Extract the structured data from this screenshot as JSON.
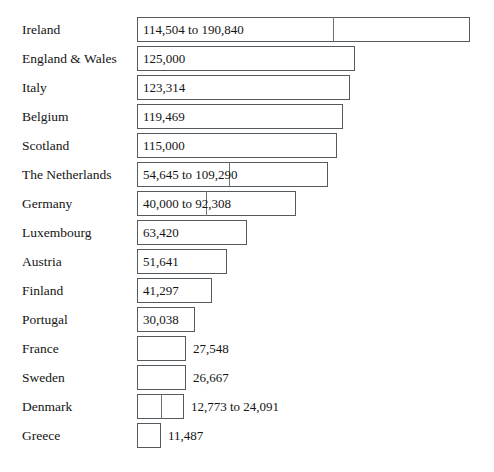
{
  "chart_data": {
    "type": "bar",
    "orientation": "horizontal",
    "title": "",
    "subtitle": "",
    "xlabel": "",
    "ylabel": "",
    "grid": false,
    "legend": null,
    "axis_visible": false,
    "value_unit": "persons",
    "note": "Horizontal bar chart; several countries show a range (low to high estimate) rendered as a bar with an inner divider marking the lower bound.",
    "categories": [
      "Ireland",
      "England & Wales",
      "Italy",
      "Belgium",
      "Scotland",
      "The Netherlands",
      "Germany",
      "Luxembourg",
      "Austria",
      "Finland",
      "Portugal",
      "France",
      "Sweden",
      "Denmark",
      "Greece"
    ],
    "values": [
      190840,
      125000,
      123314,
      119469,
      115000,
      109290,
      92308,
      63420,
      51641,
      41297,
      30038,
      27548,
      26667,
      24091,
      11487
    ],
    "low_values": [
      114504,
      null,
      null,
      null,
      null,
      54645,
      40000,
      null,
      null,
      null,
      null,
      null,
      null,
      12773,
      null
    ],
    "value_labels": [
      "114,504 to 190,840",
      "125,000",
      "123,314",
      "119,469",
      "115,000",
      "54,645 to 109,290",
      "40,000 to 92,308",
      "63,420",
      "51,641",
      "41,297",
      "30,038",
      "27,548",
      "26,667",
      "12,773 to 24,091",
      "11,487"
    ],
    "label_placement": [
      "inside",
      "inside",
      "inside",
      "inside",
      "inside",
      "inside",
      "inside",
      "inside",
      "inside",
      "inside",
      "inside",
      "outside",
      "outside",
      "outside",
      "outside"
    ],
    "xlim": [
      0,
      190840
    ]
  },
  "rows": [
    {
      "label": "Ireland",
      "value_label": "114,504 to 190,840",
      "placement": "inside",
      "top": 15,
      "bar_end": 470,
      "divider": 333
    },
    {
      "label": "England & Wales",
      "value_label": "125,000",
      "placement": "inside",
      "top": 44,
      "bar_end": 355,
      "divider": null
    },
    {
      "label": "Italy",
      "value_label": "123,314",
      "placement": "inside",
      "top": 73,
      "bar_end": 350,
      "divider": null
    },
    {
      "label": "Belgium",
      "value_label": "119,469",
      "placement": "inside",
      "top": 102,
      "bar_end": 343,
      "divider": null
    },
    {
      "label": "Scotland",
      "value_label": "115,000",
      "placement": "inside",
      "top": 131,
      "bar_end": 337,
      "divider": null
    },
    {
      "label": "The Netherlands",
      "value_label": "54,645 to 109,290",
      "placement": "inside",
      "top": 160,
      "bar_end": 328,
      "divider": 229
    },
    {
      "label": "Germany",
      "value_label": "40,000 to 92,308",
      "placement": "inside",
      "top": 189,
      "bar_end": 296,
      "divider": 206
    },
    {
      "label": "Luxembourg",
      "value_label": "63,420",
      "placement": "inside",
      "top": 218,
      "bar_end": 247,
      "divider": null
    },
    {
      "label": "Austria",
      "value_label": "51,641",
      "placement": "inside",
      "top": 247,
      "bar_end": 227,
      "divider": null
    },
    {
      "label": "Finland",
      "value_label": "41,297",
      "placement": "inside",
      "top": 276,
      "bar_end": 212,
      "divider": null
    },
    {
      "label": "Portugal",
      "value_label": "30,038",
      "placement": "inside",
      "top": 305,
      "bar_end": 195,
      "divider": null
    },
    {
      "label": "France",
      "value_label": "27,548",
      "placement": "outside",
      "top": 334,
      "bar_end": 186,
      "divider": null
    },
    {
      "label": "Sweden",
      "value_label": "26,667",
      "placement": "outside",
      "top": 363,
      "bar_end": 186,
      "divider": null
    },
    {
      "label": "Denmark",
      "value_label": "12,773 to 24,091",
      "placement": "outside",
      "top": 392,
      "bar_end": 184,
      "divider": 161
    },
    {
      "label": "Greece",
      "value_label": "11,487",
      "placement": "outside",
      "top": 421,
      "bar_end": 161,
      "divider": null
    }
  ],
  "layout": {
    "baseline_x": 137,
    "label_left": 22,
    "row_height": 29,
    "bar_height": 25,
    "value_inset": 6,
    "value_outset": 7
  },
  "colors": {
    "background": "#ffffff",
    "bar_fill": "#ffffff",
    "bar_stroke": "#555a5e",
    "divider": "#6c7277",
    "text": "#141414"
  }
}
